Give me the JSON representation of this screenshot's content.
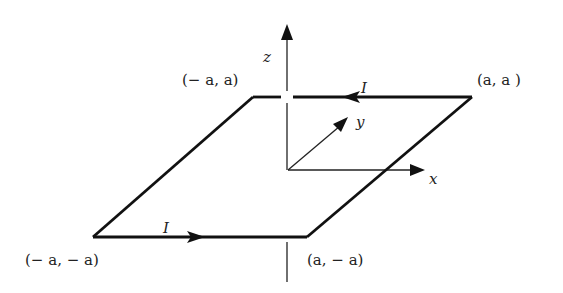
{
  "diagram": {
    "type": "current-loop-square",
    "axes": {
      "z_label": "z",
      "y_label": "y",
      "x_label": "x"
    },
    "corners": {
      "top_left": "(− a, a)",
      "top_right": "(a, a )",
      "bottom_left": "(− a, − a)",
      "bottom_right": "(a, − a)"
    },
    "currents": {
      "top_label": "I",
      "bottom_label": "I"
    },
    "colors": {
      "ink": "#111111",
      "background": "#ffffff"
    }
  }
}
